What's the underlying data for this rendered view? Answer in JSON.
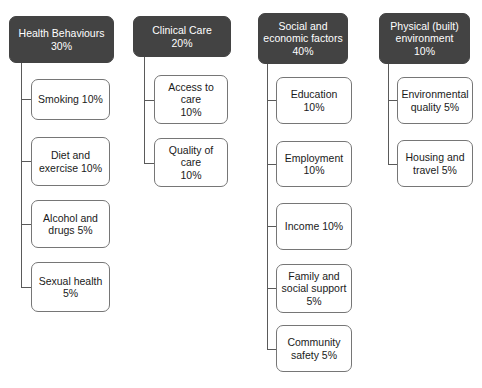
{
  "diagram": {
    "type": "tree",
    "accent_color": "#434343",
    "box_border_color": "#767676",
    "connector_color": "#5a5a5a",
    "background_color": "#ffffff",
    "columns": [
      {
        "id": "health-behaviours",
        "head": {
          "label": "Health Behaviours\n30%",
          "name": "Health Behaviours",
          "percent": "30%"
        },
        "children": [
          {
            "label": "Smoking 10%",
            "name": "Smoking",
            "percent": "10%"
          },
          {
            "label": "Diet and\nexercise 10%",
            "name": "Diet and exercise",
            "percent": "10%"
          },
          {
            "label": "Alcohol and\ndrugs 5%",
            "name": "Alcohol and drugs",
            "percent": "5%"
          },
          {
            "label": "Sexual health\n5%",
            "name": "Sexual health",
            "percent": "5%"
          }
        ]
      },
      {
        "id": "clinical-care",
        "head": {
          "label": "Clinical Care\n20%",
          "name": "Clinical Care",
          "percent": "20%"
        },
        "children": [
          {
            "label": "Access to care\n10%",
            "name": "Access to care",
            "percent": "10%"
          },
          {
            "label": "Quality of care\n10%",
            "name": "Quality of care",
            "percent": "10%"
          }
        ]
      },
      {
        "id": "social-and-economic-factors",
        "head": {
          "label": "Social and\neconomic factors\n40%",
          "name": "Social and economic factors",
          "percent": "40%"
        },
        "children": [
          {
            "label": "Education 10%",
            "name": "Education",
            "percent": "10%"
          },
          {
            "label": "Employment\n10%",
            "name": "Employment",
            "percent": "10%"
          },
          {
            "label": "Income 10%",
            "name": "Income",
            "percent": "10%"
          },
          {
            "label": "Family and\nsocial support\n5%",
            "name": "Family and social support",
            "percent": "5%"
          },
          {
            "label": "Community\nsafety 5%",
            "name": "Community safety",
            "percent": "5%"
          }
        ]
      },
      {
        "id": "physical-built-environment",
        "head": {
          "label": "Physical (built)\nenvironment\n10%",
          "name": "Physical (built) environment",
          "percent": "10%"
        },
        "children": [
          {
            "label": "Environmental\nquality 5%",
            "name": "Environmental quality",
            "percent": "5%"
          },
          {
            "label": "Housing and\ntravel 5%",
            "name": "Housing and travel",
            "percent": "5%"
          }
        ]
      }
    ]
  }
}
